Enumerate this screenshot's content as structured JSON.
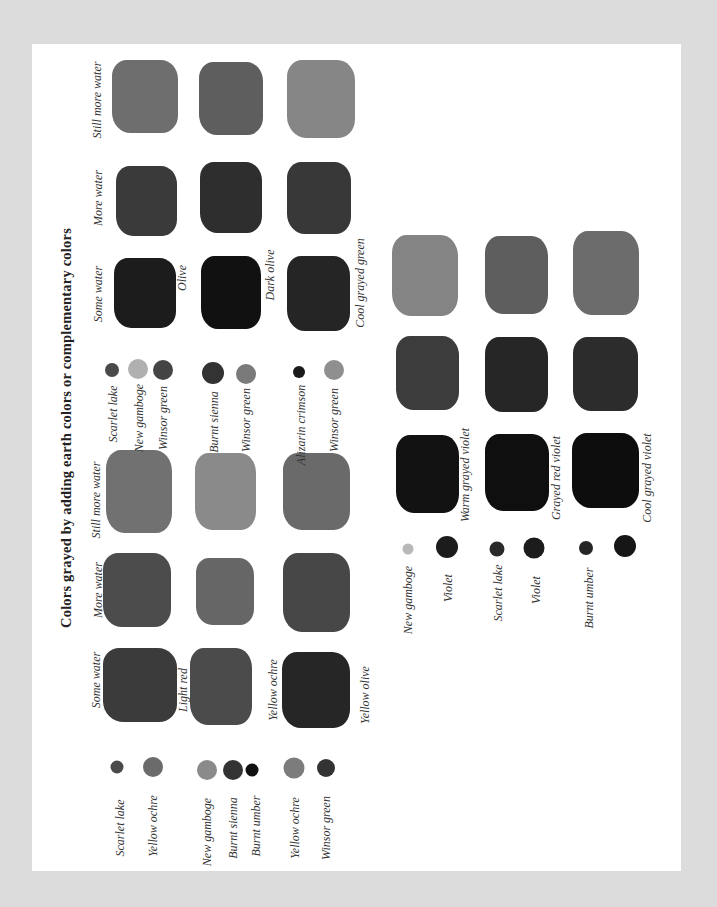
{
  "page": {
    "title": "Colors grayed by adding earth colors or complementary colors",
    "colors": {
      "background": "#dcdcdc",
      "paper": "#ffffff",
      "ink": "#333333"
    }
  },
  "left_section": {
    "column_headers": [
      "Some water",
      "More water",
      "Still more water"
    ],
    "rows": [
      {
        "ingredients": [
          {
            "name": "Scarlet lake",
            "color": "#4a4a4a"
          },
          {
            "name": "Yellow ochre",
            "color": "#6b6b6b"
          }
        ],
        "result": "Light red",
        "swatches": [
          "#3b3b3b",
          "#4c4c4c",
          "#717171"
        ]
      },
      {
        "ingredients": [
          {
            "name": "New gamboge",
            "color": "#8a8a8a"
          },
          {
            "name": "Burnt sienna",
            "color": "#333333"
          },
          {
            "name": "Burnt umber",
            "color": "#111111"
          }
        ],
        "result": "Yellow ochre",
        "swatches": [
          "#4b4b4b",
          "#666666",
          "#8a8a8a"
        ]
      },
      {
        "ingredients": [
          {
            "name": "Yellow ochre",
            "color": "#7c7c7c"
          },
          {
            "name": "Winsor green",
            "color": "#333333"
          }
        ],
        "result": "Yellow olive",
        "swatches": [
          "#262626",
          "#474747",
          "#6a6a6a"
        ]
      }
    ]
  },
  "right_section": {
    "column_headers": [
      "Some water",
      "More water",
      "Still more water"
    ],
    "rows": [
      {
        "ingredients": [
          {
            "name": "Scarlet lake",
            "color": "#4a4a4a"
          },
          {
            "name": "New gamboge",
            "color": "#b0b0b0"
          },
          {
            "name": "Winsor green",
            "color": "#444444"
          }
        ],
        "result": "Olive",
        "swatches": [
          "#1c1c1c",
          "#3a3a3a",
          "#6e6e6e"
        ]
      },
      {
        "ingredients": [
          {
            "name": "Burnt sienna",
            "color": "#333333"
          },
          {
            "name": "Winsor green",
            "color": "#7a7a7a"
          }
        ],
        "result": "Dark olive",
        "swatches": [
          "#111111",
          "#2e2e2e",
          "#5e5e5e"
        ]
      },
      {
        "ingredients": [
          {
            "name": "Alizarin crimson",
            "color": "#1a1a1a"
          },
          {
            "name": "Winsor green",
            "color": "#8f8f8f"
          }
        ],
        "result": "Cool grayed green",
        "swatches": [
          "#252525",
          "#383838",
          "#868686"
        ]
      }
    ]
  },
  "lower_section": {
    "rows": [
      {
        "ingredients": [
          {
            "name": "New gamboge",
            "color": "#b8b8b8"
          },
          {
            "name": "Violet",
            "color": "#1c1c1c"
          }
        ],
        "result": "Warm grayed violet",
        "swatches": [
          "#121212",
          "#3c3c3c",
          "#848484"
        ]
      },
      {
        "ingredients": [
          {
            "name": "Scarlet lake",
            "color": "#2a2a2a"
          },
          {
            "name": "Violet",
            "color": "#1c1c1c"
          }
        ],
        "result": "Grayed red violet",
        "swatches": [
          "#0f0f0f",
          "#262626",
          "#5e5e5e"
        ]
      },
      {
        "ingredients": [
          {
            "name": "Burnt umber",
            "color": "#262626"
          },
          {
            "name": "",
            "color": "#161616"
          }
        ],
        "result": "Cool grayed violet",
        "swatches": [
          "#0d0d0d",
          "#2c2c2c",
          "#6c6c6c"
        ]
      }
    ]
  }
}
